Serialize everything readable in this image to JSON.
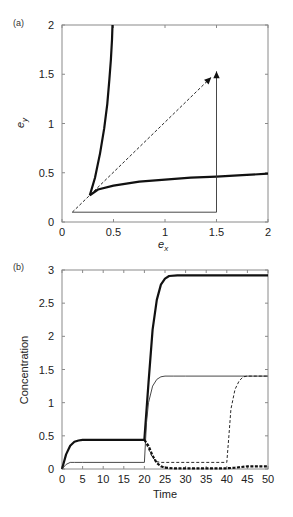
{
  "chart_data": [
    {
      "panel": "(a)",
      "type": "line",
      "title": "",
      "xlabel": "e_x",
      "ylabel": "e_y",
      "xlim": [
        0,
        2
      ],
      "ylim": [
        0,
        2
      ],
      "xticks": [
        "0",
        "0.5",
        "1",
        "1.5",
        "2"
      ],
      "yticks": [
        "0",
        "0.5",
        "1",
        "1.5",
        "2"
      ],
      "grid": false,
      "legend": null,
      "series": [
        {
          "name": "nullcline-1 (steep, thick)",
          "style": "solid-thick",
          "x": [
            0.27,
            0.32,
            0.37,
            0.41,
            0.44,
            0.46,
            0.475,
            0.485,
            0.49
          ],
          "y": [
            0.27,
            0.45,
            0.7,
            0.95,
            1.2,
            1.45,
            1.65,
            1.85,
            2.0
          ]
        },
        {
          "name": "nullcline-2 (flat, thick)",
          "style": "solid-thick",
          "x": [
            0.27,
            0.35,
            0.5,
            0.75,
            1.0,
            1.25,
            1.5,
            1.75,
            2.0
          ],
          "y": [
            0.27,
            0.33,
            0.37,
            0.41,
            0.43,
            0.45,
            0.46,
            0.475,
            0.49
          ]
        },
        {
          "name": "trajectory (diagonal, dashed)",
          "style": "dashed-arrow",
          "x": [
            0.1,
            1.45
          ],
          "y": [
            0.1,
            1.47
          ]
        },
        {
          "name": "trajectory (L-path, thin)",
          "style": "solid-thin-arrow",
          "x": [
            0.1,
            1.5,
            1.5
          ],
          "y": [
            0.1,
            0.1,
            1.53
          ]
        }
      ]
    },
    {
      "panel": "(b)",
      "type": "line",
      "title": "",
      "xlabel": "Time",
      "ylabel": "Concentration",
      "xlim": [
        0,
        50
      ],
      "ylim": [
        0,
        3
      ],
      "xticks": [
        "0",
        "5",
        "10",
        "15",
        "20",
        "25",
        "30",
        "35",
        "40",
        "45",
        "50"
      ],
      "yticks": [
        "0",
        "0.5",
        "1",
        "1.5",
        "2",
        "2.5",
        "3"
      ],
      "grid": false,
      "legend": null,
      "series": [
        {
          "name": "thick solid",
          "style": "solid-thick",
          "x": [
            0,
            1,
            2,
            3,
            4,
            5,
            10,
            19.9,
            20,
            21,
            22,
            23,
            24,
            25,
            26,
            28,
            30,
            50
          ],
          "y": [
            0,
            0.22,
            0.35,
            0.41,
            0.43,
            0.44,
            0.44,
            0.44,
            0.45,
            1.3,
            2.1,
            2.55,
            2.78,
            2.87,
            2.91,
            2.92,
            2.92,
            2.92
          ]
        },
        {
          "name": "thin solid",
          "style": "solid-thin",
          "x": [
            0,
            1,
            2,
            3,
            5,
            19.9,
            20,
            20.5,
            21,
            22,
            23,
            24,
            25,
            27,
            30,
            50
          ],
          "y": [
            0,
            0.07,
            0.1,
            0.1,
            0.1,
            0.1,
            0.1,
            0.7,
            1.0,
            1.25,
            1.35,
            1.39,
            1.4,
            1.4,
            1.4,
            1.4
          ]
        },
        {
          "name": "thick dashed",
          "style": "dashed-thick",
          "x": [
            20,
            21,
            22,
            23,
            24,
            25,
            27,
            30,
            35,
            40,
            42,
            45,
            50
          ],
          "y": [
            0.44,
            0.35,
            0.2,
            0.09,
            0.04,
            0.02,
            0.01,
            0.01,
            0.01,
            0.01,
            0.02,
            0.04,
            0.04
          ]
        },
        {
          "name": "thin dashed",
          "style": "dashed-thin",
          "x": [
            20,
            21,
            22,
            23,
            24,
            26,
            30,
            39.9,
            40,
            40.5,
            41,
            42,
            43,
            44,
            45,
            50
          ],
          "y": [
            0.44,
            0.3,
            0.17,
            0.11,
            0.1,
            0.1,
            0.1,
            0.1,
            0.1,
            0.5,
            0.9,
            1.2,
            1.33,
            1.39,
            1.4,
            1.4
          ]
        }
      ]
    }
  ]
}
